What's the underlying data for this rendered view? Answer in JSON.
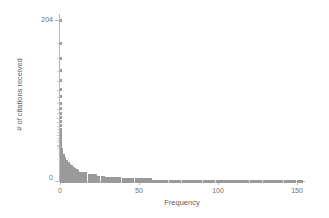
{
  "chart_data": {
    "type": "bar",
    "orientation": "horizontal",
    "title": "",
    "subtitle": "",
    "xlabel": "Frequency",
    "ylabel": "# of citations received",
    "xlim": [
      0,
      152
    ],
    "ylim": [
      0,
      212
    ],
    "grid": false,
    "legend": null,
    "x_ticks": [
      0,
      50,
      100,
      150
    ],
    "x_tick_labels": [
      "0",
      "50",
      "100",
      "150"
    ],
    "y_ticks": [
      0,
      204
    ],
    "y_tick_labels": [
      "0",
      "204"
    ],
    "marker_style": "square-dot-stack",
    "marker_color": "#9a9a9a",
    "axis_color": "#b9b9b9",
    "background": "#ffffff",
    "categories": [
      0,
      1,
      2,
      3,
      4,
      5,
      6,
      7,
      8,
      9,
      10,
      11,
      12,
      13,
      14,
      15,
      16,
      17,
      18,
      19,
      20,
      21,
      22,
      23,
      24,
      25,
      26,
      27,
      28,
      29,
      30,
      31,
      32,
      33,
      34,
      35,
      36,
      38,
      40,
      42,
      44,
      46,
      49,
      52,
      55,
      58,
      62,
      66,
      70,
      75,
      80,
      86,
      92,
      99,
      107,
      116,
      127,
      140,
      156,
      175,
      204
    ],
    "values": [
      150,
      57,
      57,
      38,
      28,
      28,
      23,
      23,
      17,
      17,
      14,
      12,
      12,
      11,
      10,
      9,
      9,
      8,
      8,
      7,
      7,
      6,
      6,
      5,
      5,
      5,
      4,
      4,
      4,
      3,
      3,
      3,
      3,
      2,
      2,
      2,
      2,
      2,
      2,
      1,
      1,
      1,
      1,
      1,
      1,
      1,
      1,
      1,
      1,
      1,
      1,
      1,
      1,
      1,
      1,
      1,
      1,
      1,
      1,
      1,
      1
    ],
    "series_name": "citation frequency"
  },
  "axes": {
    "x_title": "Frequency",
    "y_title": "# of citations received",
    "x_tick_0": "0",
    "x_tick_1": "50",
    "x_tick_2": "100",
    "x_tick_3": "150",
    "y_tick_bottom": "0",
    "y_tick_top": "204"
  }
}
